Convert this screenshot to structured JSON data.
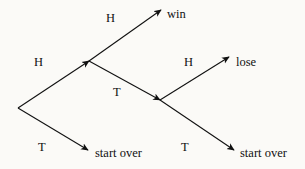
{
  "diagram": {
    "type": "probability-tree",
    "title": "",
    "background_color": "#fbfaf7",
    "stroke_color": "#111111",
    "canvas": {
      "width": 305,
      "height": 169
    },
    "nodes": [
      {
        "id": "root",
        "label": "",
        "x": 18,
        "y": 108
      },
      {
        "id": "node1",
        "label": "",
        "x": 89,
        "y": 61
      },
      {
        "id": "node2",
        "label": "",
        "x": 160,
        "y": 100
      }
    ],
    "outcomes": [
      {
        "id": "win",
        "text": "win",
        "x": 167,
        "y": 8,
        "from": "node1"
      },
      {
        "id": "lose",
        "text": "lose",
        "x": 236,
        "y": 56,
        "from": "node2"
      },
      {
        "id": "start-over-1",
        "text": "start over",
        "x": 95,
        "y": 147,
        "from": "root"
      },
      {
        "id": "start-over-2",
        "text": "start over",
        "x": 240,
        "y": 147,
        "from": "node2"
      }
    ],
    "edges": [
      {
        "id": "root-h",
        "label": "H",
        "from": "root",
        "to": "node1",
        "x1": 18,
        "y1": 108,
        "x2": 89,
        "y2": 61,
        "label_x": 34,
        "label_y": 56
      },
      {
        "id": "root-t",
        "label": "T",
        "from": "root",
        "to": "start-over-1",
        "x1": 18,
        "y1": 108,
        "x2": 88,
        "y2": 150,
        "label_x": 38,
        "label_y": 141
      },
      {
        "id": "n1-h",
        "label": "H",
        "from": "node1",
        "to": "win",
        "x1": 89,
        "y1": 61,
        "x2": 161,
        "y2": 10,
        "label_x": 106,
        "label_y": 12
      },
      {
        "id": "n1-t",
        "label": "T",
        "from": "node1",
        "to": "node2",
        "x1": 89,
        "y1": 61,
        "x2": 160,
        "y2": 100,
        "label_x": 113,
        "label_y": 86
      },
      {
        "id": "n2-h",
        "label": "H",
        "from": "node2",
        "to": "lose",
        "x1": 160,
        "y1": 100,
        "x2": 229,
        "y2": 57,
        "label_x": 184,
        "label_y": 56
      },
      {
        "id": "n2-t",
        "label": "T",
        "from": "node2",
        "to": "start-over-2",
        "x1": 160,
        "y1": 100,
        "x2": 234,
        "y2": 150,
        "label_x": 181,
        "label_y": 141
      }
    ]
  }
}
